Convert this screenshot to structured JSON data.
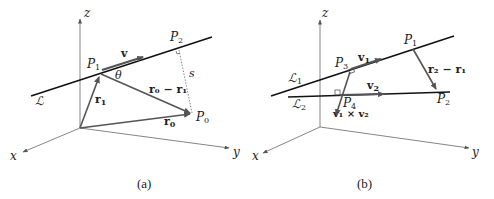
{
  "figure_a": {
    "caption": "(a)",
    "axes": {
      "x": "x",
      "y": "y",
      "z": "z"
    },
    "line_label": "ℒ",
    "points": {
      "P0": "P",
      "P0_sub": "0",
      "P1": "P",
      "P1_sub": "1",
      "P2": "P",
      "P2_sub": "2"
    },
    "vectors": {
      "v": "v",
      "r1": "r",
      "r1_sub": "1",
      "r0": "r",
      "r0_sub": "0",
      "diff": "r₀ − r₁"
    },
    "angle": "θ",
    "distance": "s"
  },
  "figure_b": {
    "caption": "(b)",
    "axes": {
      "x": "x",
      "y": "y",
      "z": "z"
    },
    "lines": {
      "L1": "ℒ",
      "L1_sub": "1",
      "L2": "ℒ",
      "L2_sub": "2"
    },
    "points": {
      "P1": "P",
      "P1_sub": "1",
      "P2": "P",
      "P2_sub": "2",
      "P3": "P",
      "P3_sub": "3",
      "P4": "P",
      "P4_sub": "4"
    },
    "vectors": {
      "v1": "v",
      "v1_sub": "1",
      "v2": "v",
      "v2_sub": "2",
      "diff": "r₂ − r₁",
      "cross": "v₁ × v₂"
    }
  },
  "colors": {
    "axis": "#555555",
    "line": "#111111",
    "vector": "#555555",
    "dotted": "#777777"
  }
}
